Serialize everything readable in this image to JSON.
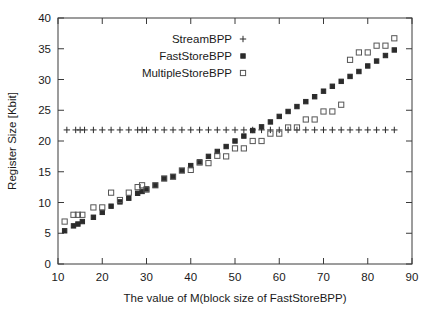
{
  "chart_data": {
    "type": "scatter",
    "title": "",
    "xlabel": "The value of M(block size of FastStoreBPP)",
    "ylabel": "Register Size [Kbit]",
    "xlim": [
      10,
      90
    ],
    "ylim": [
      0,
      40
    ],
    "xticks": [
      10,
      20,
      30,
      40,
      50,
      60,
      70,
      80,
      90
    ],
    "yticks": [
      0,
      5,
      10,
      15,
      20,
      25,
      30,
      35,
      40
    ],
    "xtick_labels": [
      "10",
      "20",
      "30",
      "40",
      "50",
      "60",
      "70",
      "80",
      "90"
    ],
    "ytick_labels": [
      "0",
      "5",
      "10",
      "15",
      "20",
      "25",
      "30",
      "35",
      "40"
    ],
    "grid": false,
    "legend_position": "top-center",
    "series": [
      {
        "name": "StreamBPP",
        "marker": "plus",
        "color": "#2b2b2b",
        "x": [
          12,
          14,
          15,
          16,
          18,
          20,
          22,
          24,
          26,
          28,
          29,
          30,
          32,
          34,
          36,
          38,
          40,
          42,
          44,
          46,
          48,
          50,
          52,
          54,
          56,
          58,
          60,
          62,
          64,
          66,
          68,
          70,
          72,
          74,
          76,
          78,
          80,
          82,
          84,
          86
        ],
        "y": [
          21.8,
          21.8,
          21.8,
          21.8,
          21.8,
          21.8,
          21.8,
          21.8,
          21.8,
          21.8,
          21.8,
          21.8,
          21.8,
          21.8,
          21.8,
          21.8,
          21.8,
          21.8,
          21.8,
          21.8,
          21.8,
          21.8,
          21.8,
          21.8,
          21.8,
          21.8,
          21.8,
          21.8,
          21.8,
          21.8,
          21.8,
          21.8,
          21.8,
          21.8,
          21.8,
          21.8,
          21.8,
          21.8,
          21.8,
          21.8
        ]
      },
      {
        "name": "FastStoreBPP",
        "marker": "star",
        "color": "#2b2b2b",
        "x": [
          11.5,
          13.5,
          14.5,
          15.5,
          18,
          20,
          22,
          24,
          26,
          28,
          29,
          30,
          32,
          34,
          36,
          38,
          40,
          42,
          44,
          46,
          48,
          50,
          52,
          54,
          56,
          58,
          60,
          62,
          64,
          66,
          68,
          70,
          72,
          74,
          76,
          78,
          80,
          82,
          84,
          86
        ],
        "y": [
          5.4,
          6.2,
          6.5,
          6.9,
          7.6,
          8.4,
          9.4,
          10.1,
          10.7,
          11.5,
          11.8,
          12.2,
          12.8,
          13.9,
          14.2,
          15.2,
          16.0,
          16.6,
          17.5,
          18.3,
          19.1,
          20.0,
          20.8,
          21.7,
          22.3,
          23.1,
          24.0,
          24.8,
          25.6,
          26.4,
          27.2,
          28.1,
          28.9,
          29.7,
          30.5,
          31.3,
          32.2,
          33.0,
          33.9,
          34.8
        ]
      },
      {
        "name": "MultipleStoreBPP",
        "marker": "square",
        "color": "#555555",
        "x": [
          11.5,
          13.5,
          14.5,
          15.5,
          18,
          20,
          22,
          24,
          26,
          28,
          29,
          30,
          32,
          34,
          36,
          38,
          40,
          42,
          44,
          46,
          48,
          50,
          52,
          54,
          56,
          58,
          60,
          62,
          64,
          66,
          68,
          70,
          72,
          74,
          76,
          78,
          80,
          82,
          84,
          86
        ],
        "y": [
          6.9,
          8.0,
          8.0,
          8.0,
          9.2,
          9.2,
          11.6,
          10.4,
          11.6,
          12.5,
          12.8,
          12.1,
          12.8,
          13.9,
          14.2,
          15.2,
          15.3,
          16.5,
          16.4,
          17.6,
          17.5,
          18.8,
          18.8,
          20.0,
          20.0,
          21.2,
          21.2,
          22.2,
          22.2,
          23.5,
          23.5,
          24.8,
          24.8,
          25.9,
          33.2,
          34.4,
          34.4,
          35.5,
          35.5,
          36.7
        ]
      }
    ]
  },
  "legend": {
    "entries": [
      {
        "label": "StreamBPP",
        "marker": "plus"
      },
      {
        "label": "FastStoreBPP",
        "marker": "star"
      },
      {
        "label": "MultipleStoreBPP",
        "marker": "square"
      }
    ]
  },
  "axes": {
    "x_title": "The value of M(block size of FastStoreBPP)",
    "y_title": "Register Size [Kbit]"
  }
}
